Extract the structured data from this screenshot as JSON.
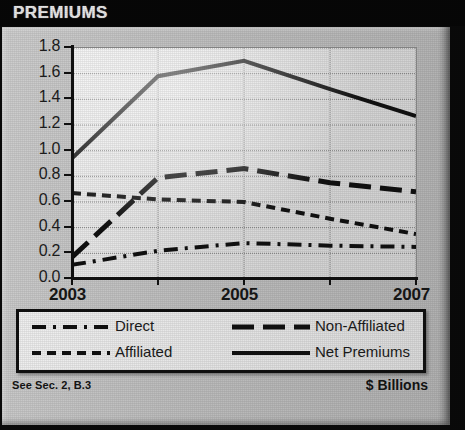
{
  "header": {
    "title": "PREMIUMS"
  },
  "footer": {
    "note": "See Sec. 2, B.3",
    "units": "$ Billions"
  },
  "chart_data": {
    "type": "line",
    "title": "PREMIUMS",
    "xlabel": "",
    "ylabel": "$ Billions",
    "grid": true,
    "legend_position": "below",
    "x": [
      2003,
      2004,
      2005,
      2006,
      2007
    ],
    "xtick_labels": [
      "2003",
      "",
      "2005",
      "",
      "2007"
    ],
    "xlim": [
      2003,
      2007
    ],
    "ylim": [
      0.0,
      1.8
    ],
    "ytick_labels": [
      "0.0",
      "0.2",
      "0.4",
      "0.6",
      "0.8",
      "1.0",
      "1.2",
      "1.4",
      "1.6",
      "1.8"
    ],
    "ytick_values": [
      0.0,
      0.2,
      0.4,
      0.6,
      0.8,
      1.0,
      1.2,
      1.4,
      1.6,
      1.8
    ],
    "series": [
      {
        "name": "Direct",
        "style": "dashdot",
        "values": [
          0.11,
          0.22,
          0.28,
          0.26,
          0.25
        ]
      },
      {
        "name": "Affiliated",
        "style": "dashed",
        "values": [
          0.67,
          0.62,
          0.6,
          0.47,
          0.35
        ]
      },
      {
        "name": "Non-Affiliated",
        "style": "longdash",
        "values": [
          0.17,
          0.79,
          0.86,
          0.75,
          0.68
        ]
      },
      {
        "name": "Net Premiums",
        "style": "solid",
        "values": [
          0.94,
          1.58,
          1.7,
          1.48,
          1.27
        ]
      }
    ]
  },
  "legend": {
    "items": [
      {
        "label": "Direct"
      },
      {
        "label": "Non-Affiliated"
      },
      {
        "label": "Affiliated"
      },
      {
        "label": "Net Premiums"
      }
    ]
  },
  "colors": {
    "ink": "#111111",
    "panel": "#b9b9b9",
    "plot": "#dcdcdc",
    "title_bg": "#070707",
    "title_fg": "#e8e8e8"
  }
}
